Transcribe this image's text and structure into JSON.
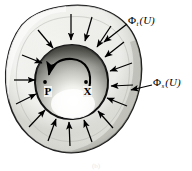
{
  "figure": {
    "caption": "(b)",
    "colors": {
      "ink": "#000000",
      "outer_ring_light": "#e9e9e5",
      "outer_ring_mid": "#c8c8c2",
      "outer_ring_dark": "#9a9a94",
      "inner_disc_dark": "#5a5a56",
      "inner_disc_highlight": "#fdfdfb",
      "background": "#ffffff",
      "label_halo": "#f2f2f0"
    }
  },
  "labels": {
    "flux_outer": {
      "symbol": "Φ",
      "subscript": "t",
      "argument": "(U)",
      "full": "Φt(U)"
    },
    "flux_inner": {
      "symbol": "Φ",
      "subscript": "s",
      "argument": "(U)",
      "full": "Φs(U)"
    },
    "point_p": "P",
    "point_x": "X"
  },
  "annotations": {
    "inward_arrow_count": 15,
    "rotation_arrow_direction": "counterclockwise",
    "leader_line_count": 2
  }
}
